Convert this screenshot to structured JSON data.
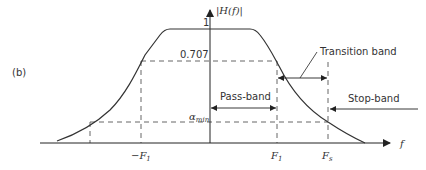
{
  "figure": {
    "panel_label": "(b)",
    "y_axis_label": "|H(f)|",
    "x_axis_label": "f",
    "levels": {
      "one": "1",
      "half_power": "0.707",
      "alpha_min_base": "α",
      "alpha_min_sub": "min"
    },
    "x_ticks": {
      "neg_f1_base": "−F",
      "neg_f1_sub": "1",
      "f1_base": "F",
      "f1_sub": "1",
      "fs_base": "F",
      "fs_sub": "s"
    },
    "annotations": {
      "pass_band": "Pass-band",
      "transition_band": "Transition band",
      "stop_band": "Stop-band"
    },
    "colors": {
      "curve": "#333333",
      "axis": "#333333",
      "dashed": "#555555"
    }
  }
}
